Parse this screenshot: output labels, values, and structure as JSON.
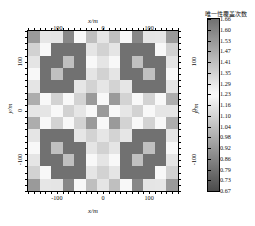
{
  "chart_data": {
    "type": "heatmap",
    "title": "",
    "xlabel": "x/m",
    "ylabel": "y/m",
    "colorbar_label": "唯一性覆盖次数",
    "grid": true,
    "xlim": [
      -162.5,
      162.5
    ],
    "ylim": [
      -162.5,
      162.5
    ],
    "xticks": [
      -100,
      0,
      100
    ],
    "yticks": [
      -100,
      0,
      100
    ],
    "xtick_labels": [
      "-100",
      "0",
      "100"
    ],
    "ytick_labels": [
      "-100",
      "0",
      "100"
    ],
    "legend_position": "right",
    "colormap": "gray-reversed-diverging",
    "zlim": [
      0.67,
      1.66
    ],
    "colorbar_ticks": [
      "1.66",
      "1.60",
      "1.53",
      "1.47",
      "1.41",
      "1.35",
      "1.29",
      "1.23",
      "1.16",
      "1.10",
      "1.04",
      "0.98",
      "0.92",
      "0.86",
      "0.79",
      "0.73",
      "0.67"
    ],
    "nrows": 13,
    "ncols": 13,
    "values": [
      [
        0.92,
        1.16,
        1.29,
        0.86,
        1.23,
        1.41,
        1.29,
        1.41,
        1.23,
        0.86,
        1.29,
        1.16,
        0.92
      ],
      [
        1.35,
        1.23,
        0.79,
        0.79,
        0.79,
        1.29,
        1.35,
        1.29,
        0.79,
        0.79,
        0.79,
        1.23,
        1.35
      ],
      [
        1.29,
        0.79,
        0.79,
        1.04,
        0.79,
        1.23,
        1.29,
        1.23,
        0.79,
        1.04,
        0.79,
        0.79,
        1.29
      ],
      [
        1.23,
        0.79,
        1.04,
        0.79,
        0.79,
        1.29,
        1.35,
        1.29,
        0.79,
        0.79,
        1.04,
        0.79,
        1.23
      ],
      [
        1.29,
        0.79,
        0.79,
        0.79,
        1.16,
        1.1,
        1.16,
        1.1,
        1.16,
        0.79,
        0.79,
        0.79,
        1.29
      ],
      [
        0.98,
        1.23,
        1.1,
        1.23,
        1.1,
        1.53,
        1.23,
        1.53,
        1.1,
        1.23,
        1.1,
        1.23,
        0.98
      ],
      [
        1.29,
        1.29,
        1.23,
        1.35,
        1.16,
        1.23,
        1.53,
        1.23,
        1.16,
        1.35,
        1.23,
        1.29,
        1.29
      ],
      [
        0.98,
        1.23,
        1.1,
        1.23,
        1.1,
        1.53,
        1.23,
        1.53,
        1.1,
        1.23,
        1.1,
        1.23,
        0.98
      ],
      [
        1.29,
        0.79,
        0.79,
        0.79,
        1.16,
        1.1,
        1.16,
        1.1,
        1.16,
        0.79,
        0.79,
        0.79,
        1.29
      ],
      [
        1.23,
        0.79,
        1.04,
        0.79,
        0.79,
        1.29,
        1.35,
        1.29,
        0.79,
        0.79,
        1.04,
        0.79,
        1.23
      ],
      [
        1.29,
        0.79,
        0.79,
        1.04,
        0.79,
        1.23,
        1.29,
        1.23,
        0.79,
        1.04,
        0.79,
        0.79,
        1.29
      ],
      [
        1.35,
        1.23,
        0.79,
        0.79,
        0.79,
        1.29,
        1.35,
        1.29,
        0.79,
        0.79,
        0.79,
        1.23,
        1.35
      ],
      [
        0.92,
        1.16,
        1.29,
        0.86,
        1.23,
        1.41,
        1.29,
        1.41,
        1.23,
        0.86,
        1.29,
        1.16,
        0.92
      ]
    ]
  },
  "axes": {
    "top_label": "x/m",
    "bottom_label": "x/m",
    "left_label": "y/m",
    "right_label": "y/m"
  }
}
